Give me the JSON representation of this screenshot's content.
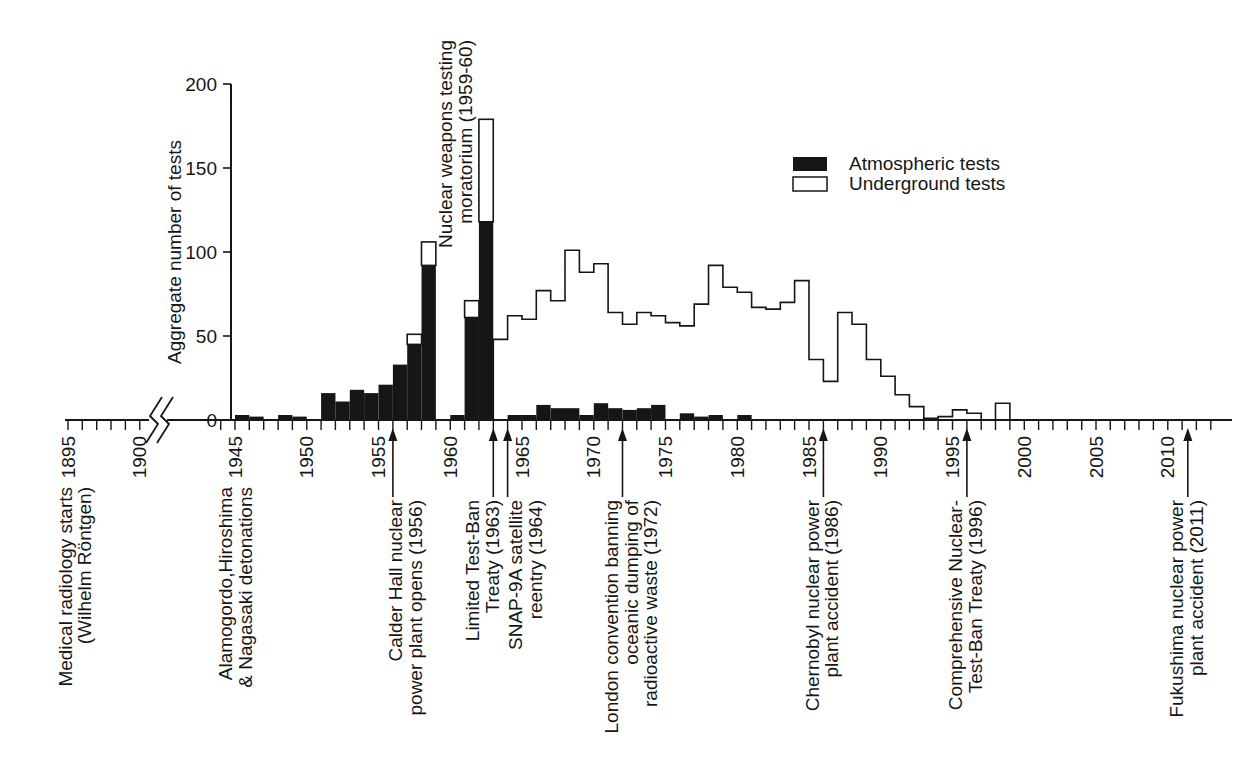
{
  "colors": {
    "ink": "#161616",
    "background": "#ffffff"
  },
  "legend": {
    "items": [
      {
        "label": "Atmospheric tests",
        "swatch": "black"
      },
      {
        "label": "Underground tests",
        "swatch": "white"
      }
    ]
  },
  "chart_data": {
    "type": "bar",
    "title": "",
    "xlabel": "",
    "ylabel": "Aggregate number of tests",
    "ylim": [
      0,
      200
    ],
    "yticks": [
      0,
      50,
      100,
      150,
      200
    ],
    "grid": false,
    "legend_position": "upper-right",
    "x_axis": {
      "segments": [
        {
          "from": 1895,
          "to": 1900
        },
        {
          "from": 1944,
          "to": 2013
        }
      ],
      "labeled_ticks": [
        1895,
        1900,
        1945,
        1950,
        1955,
        1960,
        1965,
        1970,
        1975,
        1980,
        1985,
        1990,
        1995,
        2000,
        2005,
        2010
      ],
      "break_between": [
        1900,
        1944
      ]
    },
    "series": [
      {
        "name": "Atmospheric tests",
        "render": "filled-bars",
        "fill": "#161616",
        "points": [
          [
            1945,
            3
          ],
          [
            1946,
            2
          ],
          [
            1948,
            3
          ],
          [
            1949,
            2
          ],
          [
            1951,
            16
          ],
          [
            1952,
            11
          ],
          [
            1953,
            18
          ],
          [
            1954,
            16
          ],
          [
            1955,
            21
          ],
          [
            1956,
            33
          ],
          [
            1957,
            45
          ],
          [
            1958,
            92
          ],
          [
            1960,
            3
          ],
          [
            1961,
            61
          ],
          [
            1962,
            118
          ],
          [
            1964,
            3
          ],
          [
            1965,
            3
          ],
          [
            1966,
            9
          ],
          [
            1967,
            7
          ],
          [
            1968,
            7
          ],
          [
            1969,
            3
          ],
          [
            1970,
            10
          ],
          [
            1971,
            7
          ],
          [
            1972,
            6
          ],
          [
            1973,
            7
          ],
          [
            1974,
            9
          ],
          [
            1976,
            4
          ],
          [
            1977,
            2
          ],
          [
            1978,
            3
          ],
          [
            1980,
            3
          ]
        ]
      },
      {
        "name": "Underground tests",
        "render": "white-top-stacked-on-atmospheric",
        "fill": "#ffffff",
        "points_total": [
          [
            1957,
            51
          ],
          [
            1958,
            106
          ],
          [
            1961,
            71
          ],
          [
            1962,
            179
          ]
        ]
      },
      {
        "name": "Underground tests",
        "render": "white-step-outline",
        "fill": "#ffffff",
        "points": [
          [
            1963,
            48
          ],
          [
            1964,
            62
          ],
          [
            1965,
            60
          ],
          [
            1966,
            77
          ],
          [
            1967,
            71
          ],
          [
            1968,
            101
          ],
          [
            1969,
            88
          ],
          [
            1970,
            93
          ],
          [
            1971,
            64
          ],
          [
            1972,
            57
          ],
          [
            1973,
            64
          ],
          [
            1974,
            62
          ],
          [
            1975,
            58
          ],
          [
            1976,
            56
          ],
          [
            1977,
            69
          ],
          [
            1978,
            92
          ],
          [
            1979,
            79
          ],
          [
            1980,
            76
          ],
          [
            1981,
            67
          ],
          [
            1982,
            66
          ],
          [
            1983,
            70
          ],
          [
            1984,
            83
          ],
          [
            1985,
            36
          ],
          [
            1986,
            23
          ],
          [
            1987,
            64
          ],
          [
            1988,
            57
          ],
          [
            1989,
            36
          ],
          [
            1990,
            26
          ],
          [
            1991,
            15
          ],
          [
            1992,
            8
          ],
          [
            1993,
            1
          ],
          [
            1994,
            2
          ],
          [
            1995,
            6
          ],
          [
            1996,
            4
          ],
          [
            1997,
            0
          ],
          [
            1998,
            10
          ]
        ]
      }
    ],
    "annotations": [
      {
        "slug": "medical-radiology",
        "lines": [
          "Medical radiology starts",
          "(Wilhelm Röntgen)"
        ],
        "arrow_year": null,
        "text_year": 1895.6,
        "placement": "below-axis"
      },
      {
        "slug": "alamogordo-hiroshima-nagasaki",
        "lines": [
          "Alamogordo,Hiroshima",
          "& Nagasaki detonations"
        ],
        "arrow_year": null,
        "text_year": 1945.15,
        "placement": "below-axis"
      },
      {
        "slug": "calder-hall",
        "lines": [
          "Calder Hall nuclear",
          "power plant opens (1956)"
        ],
        "arrow_year": 1956,
        "text_year": 1957,
        "placement": "below-axis"
      },
      {
        "slug": "testing-moratorium",
        "lines": [
          "Nuclear weapons testing",
          "moratorium (1959-60)"
        ],
        "arrow_year": null,
        "text_year": 1960.45,
        "placement": "in-plot"
      },
      {
        "slug": "limited-test-ban-treaty",
        "lines": [
          "Limited Test-Ban",
          "Treaty (1963)"
        ],
        "arrow_year": 1963,
        "text_year": 1962.35,
        "placement": "below-axis"
      },
      {
        "slug": "snap-9a-reentry",
        "lines": [
          "SNAP-9A satellite",
          "reentry (1964)"
        ],
        "arrow_year": 1964,
        "text_year": 1965.35,
        "placement": "below-axis"
      },
      {
        "slug": "london-convention",
        "lines": [
          "London convention banning",
          "oceanic dumping of",
          "radioactive waste (1972)"
        ],
        "arrow_year": 1972,
        "text_year": 1972.7,
        "placement": "below-axis"
      },
      {
        "slug": "chernobyl-accident",
        "lines": [
          "Chernobyl nuclear power",
          "plant accident (1986)"
        ],
        "arrow_year": 1986,
        "text_year": 1986,
        "placement": "below-axis"
      },
      {
        "slug": "comprehensive-test-ban-treaty",
        "lines": [
          "Comprehensive Nuclear-",
          "Test-Ban Treaty (1996)"
        ],
        "arrow_year": 1996,
        "text_year": 1996,
        "placement": "below-axis"
      },
      {
        "slug": "fukushima-accident",
        "lines": [
          "Fukushima nuclear power",
          "plant accident (2011)"
        ],
        "arrow_year": 2011.4,
        "text_year": 2011.4,
        "placement": "below-axis"
      }
    ]
  }
}
